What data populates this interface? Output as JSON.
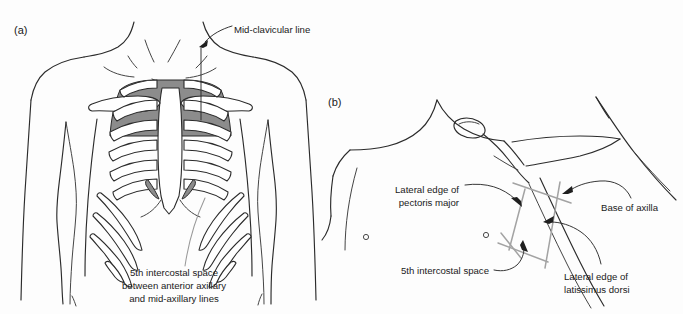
{
  "figure": {
    "background_color": "#fdfdfd",
    "line_color": "#2b2b2b",
    "shade_color": "#8c8c8c",
    "marker_color": "#a3a3a3"
  },
  "panels": [
    {
      "id": "a",
      "label": "(a)",
      "view": "anterior chest with rib cage",
      "annotations": [
        {
          "name": "mid-clavicular-line",
          "text": "Mid-clavicular line",
          "lines": [
            "Mid-clavicular line"
          ],
          "pointer": "arrow down-left to vertical mid-clavicular guide line"
        },
        {
          "name": "fifth-intercostal-space",
          "text": "5th intercostal space between anterior axillary and mid-axillary lines",
          "lines": [
            "5th intercostal space",
            "between anterior axillary",
            "and mid-axillary lines"
          ],
          "pointer": "grey leader line up-right to lateral chest wall"
        }
      ]
    },
    {
      "id": "b",
      "label": "(b)",
      "view": "lateral chest with arm abducted",
      "annotations": [
        {
          "name": "lateral-edge-pectoris-major",
          "text": "Lateral edge of pectoris major",
          "lines": [
            "Lateral edge of",
            "pectoris major"
          ],
          "pointer": "curved leader with arrowhead to anterior border of safe triangle"
        },
        {
          "name": "base-of-axilla",
          "text": "Base of axilla",
          "lines": [
            "Base of axilla"
          ],
          "pointer": "curved leader with arrowhead to apex of safe triangle"
        },
        {
          "name": "fifth-intercostal-space",
          "text": "5th intercostal space",
          "lines": [
            "5th intercostal space"
          ],
          "pointer": "curved leader with arrowhead to inferior border of safe triangle"
        },
        {
          "name": "lateral-edge-latissimus-dorsi",
          "text": "Lateral edge of latissimus dorsi",
          "lines": [
            "Lateral edge of",
            "latissimus dorsi"
          ],
          "pointer": "curved leader with arrowhead to posterior border of safe triangle"
        }
      ]
    }
  ]
}
